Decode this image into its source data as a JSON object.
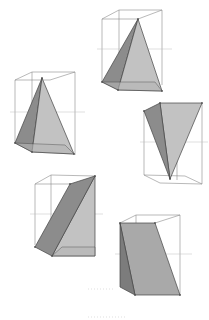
{
  "diagram": {
    "title": "",
    "colors": {
      "background": "#ffffff",
      "wireframe": "#8a8a8a",
      "face_dark": "#8c8c8c",
      "face_mid": "#a9a9a9",
      "face_light": "#c4c4c4",
      "edge": "#444444"
    },
    "figures": [
      {
        "id": "fig-1",
        "shape": "pyramid",
        "position": "top-center"
      },
      {
        "id": "fig-2",
        "shape": "pyramid",
        "position": "upper-left"
      },
      {
        "id": "fig-3",
        "shape": "inverted-pyramid",
        "position": "middle-right"
      },
      {
        "id": "fig-4",
        "shape": "wedge",
        "position": "lower-left"
      },
      {
        "id": "fig-5",
        "shape": "wedge",
        "position": "bottom-right"
      }
    ]
  }
}
